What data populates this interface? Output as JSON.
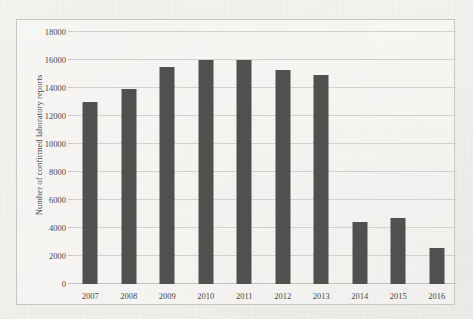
{
  "figure": {
    "background_color": "#f1f0ec",
    "border_color": "#c9c7c3",
    "bar_color": "#50504f",
    "gridline_color": "#d3d1ce",
    "text_color": "#4a4845"
  },
  "chart_data": {
    "type": "bar",
    "title": "",
    "xlabel": "",
    "ylabel": "Number of confirmed laboratory reports",
    "categories": [
      "2007",
      "2008",
      "2009",
      "2010",
      "2011",
      "2012",
      "2013",
      "2014",
      "2015",
      "2016"
    ],
    "values": [
      13000,
      13900,
      15500,
      16000,
      16000,
      15300,
      14900,
      4400,
      4700,
      2600
    ],
    "ylim": [
      0,
      18000
    ],
    "yticks": [
      0,
      2000,
      4000,
      6000,
      8000,
      10000,
      12000,
      14000,
      16000,
      18000
    ],
    "ytick_labels": [
      "0",
      "2000",
      "4000",
      "6000",
      "8000",
      "10000",
      "12000",
      "14000",
      "16000",
      "18000"
    ],
    "grid": "horizontal",
    "legend": "none",
    "series": [
      {
        "name": "Number of confirmed laboratory reports",
        "values": [
          13000,
          13900,
          15500,
          16000,
          16000,
          15300,
          14900,
          4400,
          4700,
          2600
        ]
      }
    ]
  }
}
